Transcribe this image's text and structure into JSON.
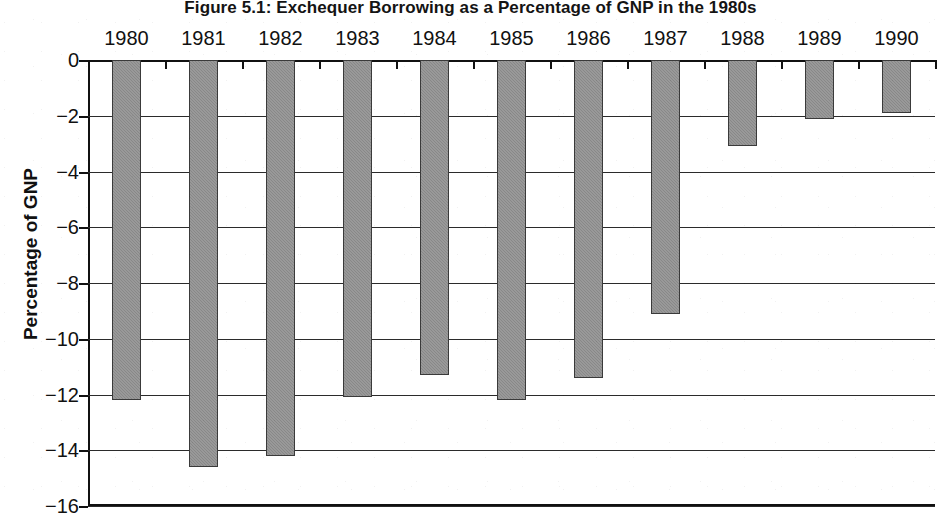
{
  "chart_data": {
    "type": "bar",
    "title": "Figure 5.1: Exchequer Borrowing as a Percentage of GNP in the 1980s",
    "xlabel": "",
    "ylabel": "Percentage of GNP",
    "categories": [
      "1980",
      "1981",
      "1982",
      "1983",
      "1984",
      "1985",
      "1986",
      "1987",
      "1988",
      "1989",
      "1990"
    ],
    "values": [
      -12.2,
      -14.6,
      -14.2,
      -12.1,
      -11.3,
      -12.2,
      -11.4,
      -9.1,
      -3.1,
      -2.1,
      -1.9
    ],
    "ylim": [
      -16,
      0
    ],
    "yticks": [
      0,
      -2,
      -4,
      -6,
      -8,
      -10,
      -12,
      -14,
      -16
    ],
    "ytick_labels": [
      "0",
      "−2",
      "−4",
      "−6",
      "−8",
      "−10",
      "−12",
      "−14",
      "−16"
    ],
    "xaxis_position": "top",
    "grid": true,
    "legend": "none",
    "series_name": "Exchequer Borrowing",
    "bar_fill_color": "#8d8d8d",
    "bar_border_color": "#3a3a3a",
    "axis_color": "#111111",
    "background_color": "#ffffff"
  }
}
